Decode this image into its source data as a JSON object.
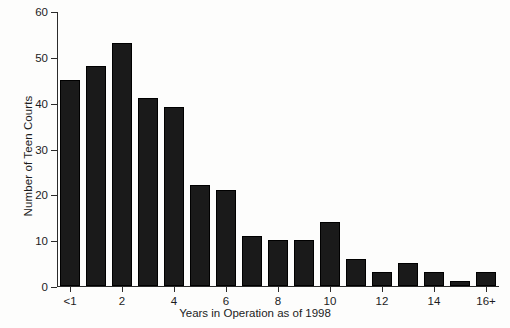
{
  "chart_data": {
    "type": "bar",
    "title": "",
    "xlabel": "Years in Operation as of 1998",
    "ylabel": "Number of Teen Courts",
    "categories": [
      "<1",
      "1",
      "2",
      "3",
      "4",
      "5",
      "6",
      "7",
      "8",
      "9",
      "10",
      "11",
      "12",
      "13",
      "14",
      "15",
      "16+"
    ],
    "values": [
      45,
      48,
      53,
      41,
      39,
      22,
      21,
      11,
      10,
      10,
      14,
      6,
      3,
      5,
      3,
      1,
      3
    ],
    "x_tick_labels": [
      "<1",
      "2",
      "4",
      "6",
      "8",
      "10",
      "12",
      "14",
      "16+"
    ],
    "x_tick_category_indices": [
      0,
      2,
      4,
      6,
      8,
      10,
      12,
      14,
      16
    ],
    "y_ticks": [
      0,
      10,
      20,
      30,
      40,
      50,
      60
    ],
    "ylim": [
      0,
      60
    ],
    "grid": false,
    "legend": false,
    "bar_color": "#1a1a1a",
    "axis_color": "#2b2b2b",
    "background_color": "#fdfdfc"
  }
}
